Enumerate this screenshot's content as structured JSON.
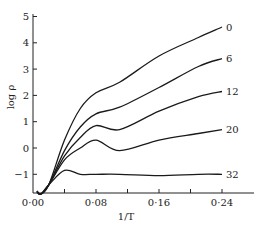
{
  "chart_data": {
    "type": "line",
    "title": "",
    "xlabel": "1/T",
    "ylabel": "log ρ",
    "xlim": [
      0.0,
      0.26
    ],
    "ylim": [
      -1.9,
      5.0
    ],
    "grid": false,
    "legend": "inline labels at line ends",
    "x_ticks": [
      0.0,
      0.04,
      0.08,
      0.12,
      0.16,
      0.2,
      0.24
    ],
    "x_tick_labels": [
      "0·00",
      "",
      "0·08",
      "",
      "0·16",
      "",
      "0·24"
    ],
    "y_ticks": [
      -1,
      0,
      1,
      2,
      3,
      4,
      5
    ],
    "y_tick_labels": [
      "−1",
      "0",
      "1",
      "2",
      "3",
      "4",
      "5"
    ],
    "x": [
      0.005,
      0.01,
      0.02,
      0.04,
      0.06,
      0.08,
      0.11,
      0.16,
      0.21,
      0.24
    ],
    "series": [
      {
        "name": "0",
        "values": [
          -1.65,
          -1.75,
          -1.4,
          0.3,
          1.5,
          2.1,
          2.5,
          3.5,
          4.2,
          4.6
        ]
      },
      {
        "name": "6",
        "values": [
          -1.65,
          -1.75,
          -1.4,
          -0.1,
          0.8,
          1.3,
          1.55,
          2.3,
          3.1,
          3.4
        ]
      },
      {
        "name": "12",
        "values": [
          -1.65,
          -1.75,
          -1.4,
          -0.3,
          0.4,
          0.85,
          0.7,
          1.4,
          1.95,
          2.15
        ]
      },
      {
        "name": "20",
        "values": [
          -1.65,
          -1.75,
          -1.4,
          -0.45,
          0.0,
          0.3,
          -0.1,
          0.3,
          0.55,
          0.7
        ]
      },
      {
        "name": "32",
        "values": [
          -1.65,
          -1.75,
          -1.4,
          -0.85,
          -1.0,
          -1.0,
          -1.0,
          -1.05,
          -1.0,
          -1.0
        ]
      }
    ]
  }
}
